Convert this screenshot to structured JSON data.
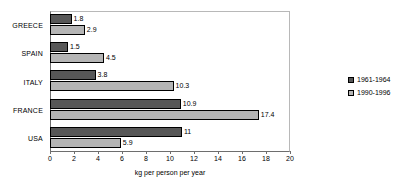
{
  "chart_data": {
    "type": "bar",
    "orientation": "horizontal",
    "title": "",
    "xlabel": "kg per person per year",
    "ylabel": "",
    "xlim": [
      0,
      20
    ],
    "xticks": [
      0,
      2,
      4,
      6,
      8,
      10,
      12,
      14,
      16,
      18,
      20
    ],
    "xtick_labels": [
      "0",
      "2",
      "4",
      "6",
      "8",
      "10",
      "12",
      "14",
      "16",
      "18",
      "20"
    ],
    "grid": false,
    "legend_position": "right",
    "categories": [
      "GREECE",
      "SPAIN",
      "ITALY",
      "FRANCE",
      "USA"
    ],
    "series": [
      {
        "name": "1961-1964",
        "color": "#575757",
        "values": [
          1.8,
          1.5,
          3.8,
          10.9,
          11
        ],
        "labels": [
          "1.8",
          "1.5",
          "3.8",
          "10.9",
          "11"
        ]
      },
      {
        "name": "1990-1996",
        "color": "#b5b5b5",
        "values": [
          2.9,
          4.5,
          10.3,
          17.4,
          5.9
        ],
        "labels": [
          "2.9",
          "4.5",
          "10.3",
          "17.4",
          "5.9"
        ]
      }
    ]
  },
  "legend": {
    "entries": [
      {
        "label": "1961-1964",
        "color": "#575757"
      },
      {
        "label": "1990-1996",
        "color": "#b5b5b5"
      }
    ]
  }
}
